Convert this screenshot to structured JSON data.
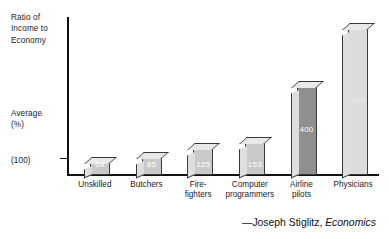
{
  "chart_data": {
    "type": "bar",
    "title": "",
    "ylabel": "Ratio of Income to\nEconomy",
    "xlabel": "",
    "categories": [
      "Unskilled",
      "Butchers",
      "Fire-\nfighters",
      "Computer\nprogrammers",
      "Airline\npilots",
      "Physicians"
    ],
    "values": [
      64,
      85,
      125,
      153,
      400,
      660
    ],
    "value_labels": [
      "64",
      "85",
      "125",
      "153",
      "400",
      "660"
    ],
    "ylim": [
      0,
      700
    ],
    "grid": false,
    "legend": null,
    "annotations": {
      "y_axis_top_label": "Ratio of\nIncome to\nEconomy",
      "y_axis_average_label": "Average\n(%)",
      "y_axis_baseline_label": "(100)",
      "baseline_value": 100
    },
    "bar_colors": [
      "#c9c9c9",
      "#c9c9c9",
      "#c9c9c9",
      "#c9c9c9",
      "#8f8f8f",
      "#dcdcdc"
    ]
  },
  "axis": {
    "y_title_top": "Ratio of\nIncome to\nEconomy",
    "y_title_average": "Average\n(%)",
    "y_title_baseline": "(100)"
  },
  "caption": {
    "attribution": "—Joseph Stiglitz,",
    "work": "Economics"
  }
}
